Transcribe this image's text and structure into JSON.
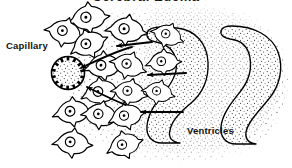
{
  "figure": {
    "title": "Cerebral Edema",
    "width": 292,
    "height": 168,
    "background_color": "#ffffff",
    "ink_color": "#000000",
    "stipple_color": "#4a4a4a",
    "type": "line-art-diagram"
  },
  "labels": {
    "capillary": "Capillary",
    "ventricles": "Ventricles"
  },
  "legend_note": {
    "arrow_meaning": "direction of edema fluid flow from ventricles toward capillary"
  },
  "structures": {
    "capillary": {
      "name": "capillary-lumen",
      "center_x": 68,
      "center_y": 73,
      "radius": 17,
      "wall_ticks": 14,
      "fill": "stipple"
    },
    "ventricles": [
      {
        "name": "lateral-ventricle-left",
        "fill": "stipple"
      },
      {
        "name": "lateral-ventricle-right",
        "fill": "stipple"
      }
    ],
    "parenchyma_stipple": {
      "name": "brain-tissue-stipple",
      "fill": "stipple"
    }
  },
  "cells": [
    {
      "name": "glial-cell",
      "x": 88,
      "y": 18,
      "s": 1.0,
      "r": -8
    },
    {
      "name": "glial-cell",
      "x": 64,
      "y": 32,
      "s": 0.95,
      "r": 14
    },
    {
      "name": "glial-cell",
      "x": 88,
      "y": 44,
      "s": 0.95,
      "r": -22
    },
    {
      "name": "glial-cell",
      "x": 126,
      "y": 30,
      "s": 1.0,
      "r": 6
    },
    {
      "name": "glial-cell",
      "x": 103,
      "y": 66,
      "s": 0.95,
      "r": -6
    },
    {
      "name": "glial-cell",
      "x": 128,
      "y": 65,
      "s": 0.9,
      "r": 18
    },
    {
      "name": "glial-cell",
      "x": 100,
      "y": 92,
      "s": 0.95,
      "r": -12
    },
    {
      "name": "glial-cell",
      "x": 129,
      "y": 92,
      "s": 0.88,
      "r": 10
    },
    {
      "name": "glial-cell",
      "x": 72,
      "y": 112,
      "s": 0.95,
      "r": -6
    },
    {
      "name": "glial-cell",
      "x": 100,
      "y": 115,
      "s": 0.92,
      "r": 8
    },
    {
      "name": "glial-cell",
      "x": 126,
      "y": 116,
      "s": 0.9,
      "r": -14
    },
    {
      "name": "glial-cell",
      "x": 72,
      "y": 143,
      "s": 0.95,
      "r": 4
    },
    {
      "name": "glial-cell",
      "x": 124,
      "y": 145,
      "s": 0.9,
      "r": -18
    },
    {
      "name": "glial-cell",
      "x": 163,
      "y": 62,
      "s": 0.85,
      "r": -4
    },
    {
      "name": "glial-cell",
      "x": 158,
      "y": 92,
      "s": 0.8,
      "r": 12
    },
    {
      "name": "glial-cell",
      "x": 167,
      "y": 35,
      "s": 0.82,
      "r": 20
    }
  ],
  "arrows": [
    {
      "name": "flow-arrow-upper",
      "x1": 152,
      "y1": 42,
      "x2": 117,
      "y2": 46
    },
    {
      "name": "flow-arrow-middle",
      "x1": 186,
      "y1": 73,
      "x2": 148,
      "y2": 75
    },
    {
      "name": "flow-arrow-lower",
      "x1": 183,
      "y1": 112,
      "x2": 141,
      "y2": 112
    },
    {
      "name": "flow-arrow-to-capillary-upper",
      "x1": 132,
      "y1": 47,
      "x2": 79,
      "y2": 68
    },
    {
      "name": "flow-arrow-to-capillary-lower",
      "x1": 124,
      "y1": 104,
      "x2": 85,
      "y2": 86
    }
  ]
}
